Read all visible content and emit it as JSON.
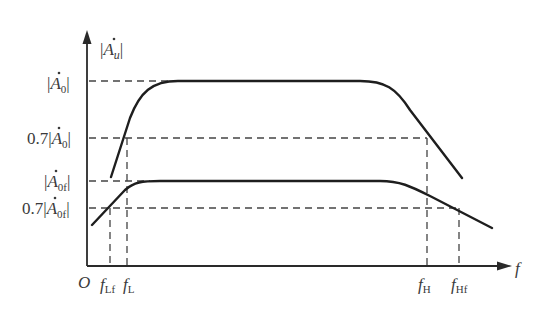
{
  "diagram": {
    "type": "frequency-response",
    "y_axis": {
      "label_main": "|A",
      "label_sub": "u",
      "label_end": "|",
      "dot_over": "A"
    },
    "x_axis": {
      "label": "f",
      "origin": "O"
    },
    "y_ticks": [
      {
        "id": "A0",
        "prefix": "|",
        "main": "A",
        "sub": "0",
        "suffix": "|",
        "coef": ""
      },
      {
        "id": "07A0",
        "prefix": "|",
        "main": "A",
        "sub": "0",
        "suffix": "|",
        "coef": "0.7"
      },
      {
        "id": "A0f",
        "prefix": "|",
        "main": "A",
        "sub": "0f",
        "suffix": "|",
        "coef": ""
      },
      {
        "id": "07A0f",
        "prefix": "|",
        "main": "A",
        "sub": "0f",
        "suffix": "|",
        "coef": "0.7"
      }
    ],
    "x_ticks": [
      {
        "id": "fLf",
        "main": "f",
        "sub": "Lf"
      },
      {
        "id": "fL",
        "main": "f",
        "sub": "L"
      },
      {
        "id": "fH",
        "main": "f",
        "sub": "H"
      },
      {
        "id": "fHf",
        "main": "f",
        "sub": "Hf"
      }
    ],
    "curves": [
      {
        "name": "open-loop gain |A0|",
        "passband_level": "|A0|",
        "cutoffs": [
          "fL",
          "fH"
        ]
      },
      {
        "name": "closed-loop gain |A0f|",
        "passband_level": "|A0f|",
        "cutoffs": [
          "fLf",
          "fHf"
        ]
      }
    ],
    "colors": {
      "curve": "#1e1e1e",
      "axis": "#2a2a2a",
      "dash": "#444444",
      "text": "#3a3a3a"
    }
  }
}
